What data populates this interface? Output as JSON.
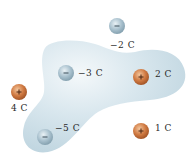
{
  "diagram": {
    "surface_color": "#c9dde6",
    "colors": {
      "positive": "#c8703a",
      "negative": "#9fb8c6"
    },
    "charges": [
      {
        "id": "q1",
        "label": "−2 C",
        "sign": "-",
        "cx": 117,
        "cy": 26,
        "label_x": 110,
        "label_y": 40,
        "inside": false
      },
      {
        "id": "q2",
        "label": "−3 C",
        "sign": "-",
        "cx": 66,
        "cy": 73,
        "label_x": 78,
        "label_y": 68,
        "inside": true
      },
      {
        "id": "q3",
        "label": "2 C",
        "sign": "+",
        "cx": 141,
        "cy": 77,
        "label_x": 155,
        "label_y": 69,
        "inside": true
      },
      {
        "id": "q4",
        "label": "4 C",
        "sign": "+",
        "cx": 19,
        "cy": 92,
        "label_x": 11,
        "label_y": 103,
        "inside": false
      },
      {
        "id": "q5",
        "label": "−5 C",
        "sign": "-",
        "cx": 45,
        "cy": 137,
        "label_x": 55,
        "label_y": 123,
        "inside": true
      },
      {
        "id": "q6",
        "label": "1 C",
        "sign": "+",
        "cx": 141,
        "cy": 131,
        "label_x": 155,
        "label_y": 123,
        "inside": false
      }
    ]
  }
}
